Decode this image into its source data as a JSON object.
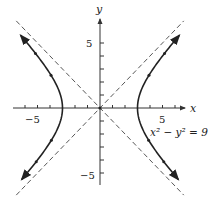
{
  "chart_data": {
    "type": "line",
    "title": "",
    "equation_label": "x² − y² = 9",
    "equation": {
      "a2": 9,
      "form": "x^2 - y^2 = 9"
    },
    "xlabel": "x",
    "ylabel": "y",
    "xlim": [
      -7,
      7
    ],
    "ylim": [
      -6,
      6.5
    ],
    "x_ticks": [
      -6,
      -5,
      -4,
      -3,
      -2,
      -1,
      1,
      2,
      3,
      4,
      5,
      6
    ],
    "y_ticks": [
      -5,
      -4,
      -3,
      -2,
      -1,
      1,
      2,
      3,
      4,
      5
    ],
    "x_tick_labels": [
      {
        "value": -5,
        "text": "−5"
      },
      {
        "value": 5,
        "text": "5"
      }
    ],
    "y_tick_labels": [
      {
        "value": 5,
        "text": "5"
      },
      {
        "value": -5,
        "text": "−5"
      }
    ],
    "asymptotes": [
      {
        "name": "y = x",
        "slope": 1,
        "style": "dashed"
      },
      {
        "name": "y = -x",
        "slope": -1,
        "style": "dashed"
      }
    ],
    "series": [
      {
        "name": "right branch",
        "vertex": [
          3,
          0
        ],
        "y_range": [
          -5.5,
          5.6
        ],
        "arrows": "outward"
      },
      {
        "name": "left branch",
        "vertex": [
          -3,
          0
        ],
        "y_range": [
          -5.5,
          5.6
        ],
        "arrows": "outward"
      }
    ],
    "grid": false,
    "legend": "none"
  },
  "labels": {
    "x_axis": "x",
    "y_axis": "y",
    "x_neg5": "−5",
    "x_pos5": "5",
    "y_pos5": "5",
    "y_neg5": "−5",
    "equation": "x² − y² = 9"
  },
  "colors": {
    "curve": "#222222",
    "axis": "#333333",
    "asymptote": "#444444"
  }
}
